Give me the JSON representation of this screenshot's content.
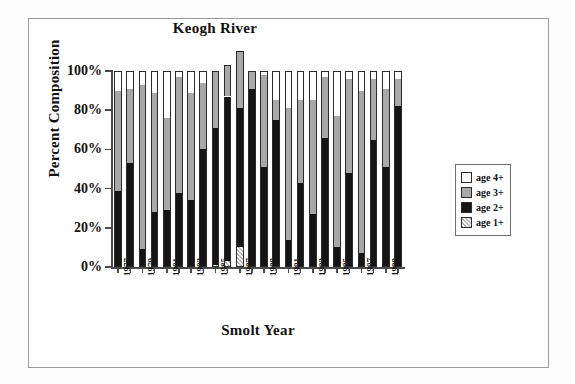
{
  "chart_data": {
    "type": "bar",
    "stacked": true,
    "title": "Keogh River",
    "xlabel": "Smolt Year",
    "ylabel": "Percent Composition",
    "ylim": [
      0,
      100
    ],
    "yticks": [
      "0%",
      "20%",
      "40%",
      "60%",
      "80%",
      "100%"
    ],
    "ytick_values": [
      0,
      20,
      40,
      60,
      80,
      100
    ],
    "grid": false,
    "legend_position": "right",
    "categories": [
      "1977",
      "1978",
      "1979",
      "1980",
      "1981",
      "1982",
      "1983",
      "1984",
      "1985",
      "1986",
      "1987",
      "1988",
      "1989",
      "1990",
      "1991",
      "1992",
      "1993",
      "1994",
      "1995",
      "1996",
      "1997",
      "1998",
      "1999",
      "2000"
    ],
    "xtick_labels": [
      "1977",
      "",
      "1979",
      "",
      "1981",
      "",
      "1983",
      "",
      "1985",
      "",
      "1987",
      "",
      "1989",
      "",
      "1991",
      "",
      "1993",
      "",
      "1995",
      "",
      "1997",
      "",
      "1999",
      ""
    ],
    "series": [
      {
        "name": "age 1+",
        "color": "#dcdcdc",
        "pattern": "checker",
        "values": [
          0,
          0,
          0,
          0,
          0,
          0,
          0,
          0,
          1,
          3,
          10,
          0,
          0,
          0,
          0,
          0,
          0,
          0,
          0,
          0,
          0,
          0,
          0,
          0
        ]
      },
      {
        "name": "age 2+",
        "color": "#151515",
        "pattern": "solid",
        "values": [
          39,
          53,
          9,
          28,
          29,
          38,
          34,
          60,
          70,
          84,
          71,
          91,
          51,
          75,
          14,
          43,
          27,
          66,
          10,
          48,
          7,
          65,
          51,
          82
        ]
      },
      {
        "name": "age 3+",
        "color": "#a8a8a8",
        "pattern": "solid",
        "values": [
          51,
          38,
          84,
          61,
          47,
          59,
          55,
          34,
          29,
          16,
          29,
          9,
          47,
          10,
          67,
          42,
          58,
          31,
          67,
          48,
          83,
          31,
          40,
          14
        ]
      },
      {
        "name": "age 4+",
        "color": "#ffffff",
        "pattern": "solid",
        "values": [
          10,
          9,
          7,
          11,
          24,
          3,
          11,
          6,
          0,
          0,
          0,
          0,
          2,
          15,
          19,
          15,
          15,
          3,
          23,
          4,
          10,
          4,
          9,
          4
        ]
      }
    ]
  },
  "legend": {
    "items": [
      {
        "label": "age 4+",
        "swatch": "white"
      },
      {
        "label": "age 3+",
        "swatch": "gray"
      },
      {
        "label": "age 2+",
        "swatch": "black"
      },
      {
        "label": "age 1+",
        "swatch": "checker"
      }
    ]
  }
}
